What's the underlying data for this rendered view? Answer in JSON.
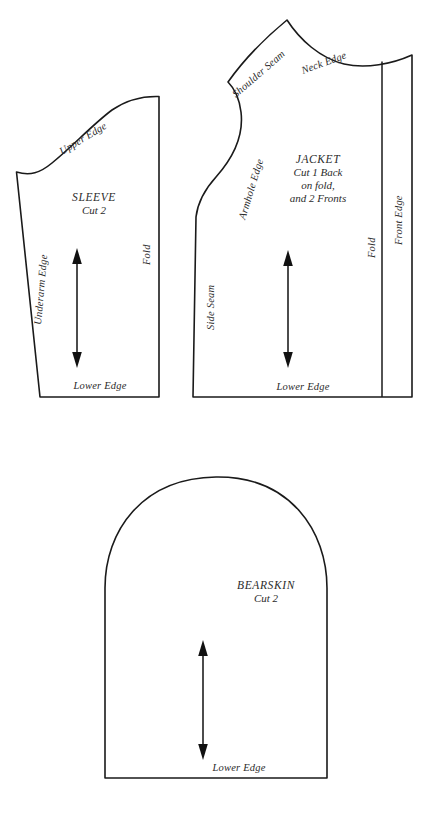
{
  "document": {
    "kind": "sewing-pattern-layout-diagram",
    "background_color": "#ffffff",
    "ink_color": "#1a1a1a"
  },
  "pieces": {
    "sleeve": {
      "title": "SLEEVE",
      "cut_instruction": "Cut 2",
      "labels": {
        "upper_edge": "Upper Edge",
        "underarm_edge": "Underarm Edge",
        "fold": "Fold",
        "lower_edge": "Lower Edge"
      }
    },
    "jacket": {
      "title": "JACKET",
      "cut_line_1": "Cut 1 Back",
      "cut_line_2": "on fold,",
      "cut_line_3": "and 2 Fronts",
      "labels": {
        "shoulder_seam": "Shoulder Seam",
        "neck_edge": "Neck Edge",
        "armhole_edge": "Armhole Edge",
        "side_seam": "Side Seam",
        "fold": "Fold",
        "front_edge": "Front Edge",
        "lower_edge": "Lower Edge"
      }
    },
    "bearskin": {
      "title": "BEARSKIN",
      "cut_instruction": "Cut 2",
      "labels": {
        "lower_edge": "Lower Edge"
      }
    }
  }
}
